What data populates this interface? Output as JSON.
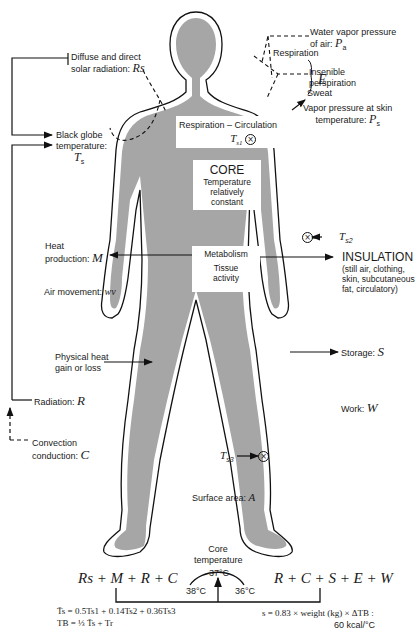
{
  "figure": {
    "colors": {
      "body_fill": "#a6a6a6",
      "outline": "#111111",
      "background": "#ffffff",
      "label_box": "#ffffff"
    },
    "body_boxes": {
      "respiration_circulation": {
        "label": "Respiration – Circulation",
        "sensor": "T",
        "sensor_sub": "s1"
      },
      "core": {
        "title": "CORE",
        "line1": "Temperature",
        "line2": "relatively",
        "line3": "constant"
      },
      "metabolism": {
        "label": "Metabolism",
        "line1": "Tissue",
        "line2": "activity"
      }
    },
    "left_labels": {
      "solar": {
        "line1": "Diffuse and direct",
        "line2": "solar radiation:",
        "symbol": "Rs"
      },
      "black_globe": {
        "line1": "Black globe",
        "line2": "temperature:",
        "symbol": "T",
        "sub": "s"
      },
      "heat_production": {
        "line1": "Heat",
        "line2": "production:",
        "symbol": "M"
      },
      "air_movement": {
        "text": "Air movement:",
        "symbol": "wv"
      },
      "physical_heat": {
        "line1": "Physical heat",
        "line2": "gain or loss"
      },
      "radiation": {
        "text": "Radiation:",
        "symbol": "R"
      },
      "convection": {
        "line1": "Convection",
        "line2": "conduction:",
        "symbol": "C"
      }
    },
    "right_labels": {
      "water_vapor": {
        "line1": "Water vapor pressure",
        "line2": "of air:",
        "symbol": "P",
        "sub": "a"
      },
      "respiration": "Respiration",
      "insensible": {
        "line1": "Insenible",
        "line2": "perspiration",
        "symbol": "E"
      },
      "sweat": "Sweat",
      "vapor_skin": {
        "line1": "Vapor pressure at skin",
        "line2": "temperature:",
        "symbol": "P",
        "sub": "s"
      },
      "ts2": {
        "symbol": "T",
        "sub": "s2"
      },
      "insulation": {
        "title": "INSULATION",
        "line1": "(still air, clothing,",
        "line2": "skin, subcutaneous",
        "line3": "fat, circulatory)"
      },
      "storage": {
        "text": "Storage:",
        "symbol": "S"
      },
      "work": {
        "text": "Work:",
        "symbol": "W"
      }
    },
    "lower_labels": {
      "ts3": {
        "symbol": "T",
        "sub": "s3"
      },
      "surface_area": {
        "text": "Surface area:",
        "symbol": "A"
      },
      "core_temp": {
        "line1": "Core",
        "line2": "temperature",
        "center": "37°C",
        "left": "38°C",
        "right": "36°C"
      }
    },
    "equations": {
      "gain": "Rs + M + R + C",
      "loss": "R + C + S + E + W",
      "mean_skin": "T̄s = 0.5Ts1 + 0.14Ts2 + 0.36Ts3",
      "body_temp": "TB = ⅓ T̄s + Tr",
      "storage_formula_line1": "s = 0.83 × weight (kg) × ΔTB :",
      "storage_formula_line2": "60 kcal/°C"
    }
  }
}
